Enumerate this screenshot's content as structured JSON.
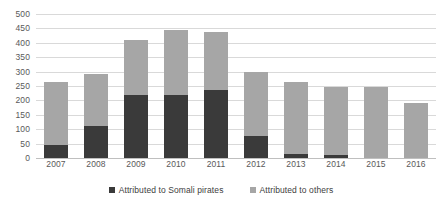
{
  "chart_data": {
    "type": "bar",
    "subtype": "stacked-vertical",
    "title": "",
    "xlabel": "",
    "ylabel": "",
    "ylim": [
      0,
      500
    ],
    "ytick_step": 50,
    "yticks": [
      500,
      450,
      400,
      350,
      300,
      250,
      200,
      150,
      100,
      50,
      0
    ],
    "grid": true,
    "grid_axis": "y",
    "legend_position": "bottom",
    "categories": [
      "2007",
      "2008",
      "2009",
      "2010",
      "2011",
      "2012",
      "2013",
      "2014",
      "2015",
      "2016"
    ],
    "series": [
      {
        "name": "Attributed to Somali pirates",
        "color": "#3a3a3a",
        "values": [
          46,
          111,
          218,
          219,
          237,
          75,
          15,
          11,
          0,
          0
        ]
      },
      {
        "name": "Attributed to others",
        "color": "#a6a6a6",
        "values": [
          217,
          182,
          192,
          226,
          202,
          222,
          249,
          234,
          246,
          191
        ]
      }
    ],
    "totals": [
      263,
      293,
      410,
      445,
      439,
      297,
      264,
      245,
      246,
      191
    ]
  },
  "legend": {
    "items": [
      {
        "label": "Attributed to Somali pirates",
        "swatch": "somali"
      },
      {
        "label": "Attributed to others",
        "swatch": "others"
      }
    ]
  },
  "colors": {
    "series_somali": "#3a3a3a",
    "series_others": "#a6a6a6",
    "gridline": "#d9d9d9",
    "baseline": "#bfbfbf",
    "tick_text": "#595959",
    "background": "#ffffff"
  }
}
